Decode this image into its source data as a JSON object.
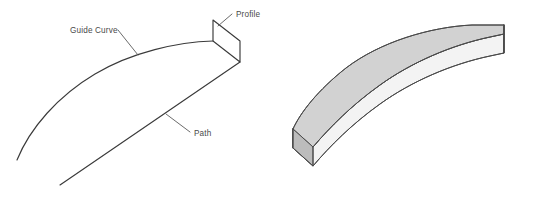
{
  "figure": {
    "background_color": "#ffffff",
    "line_color": "#3a3a3a",
    "leader_color": "#5a5a5a"
  },
  "labels": {
    "guide_curve": "Guide Curve",
    "profile": "Profile",
    "path": "Path"
  },
  "left_panel": {
    "name": "wireframe-construction",
    "guide_curve": {
      "name": "guide-curve",
      "type": "arc",
      "start": [
        17,
        160
      ],
      "end": [
        213,
        41
      ],
      "control": [
        90,
        92
      ]
    },
    "path": {
      "name": "path",
      "type": "line",
      "start": [
        60,
        185
      ],
      "end": [
        240,
        62
      ]
    },
    "profile": {
      "name": "profile",
      "type": "parallelogram",
      "vertices": [
        [
          213,
          20
        ],
        [
          240,
          41
        ],
        [
          240,
          62
        ],
        [
          213,
          41
        ]
      ]
    },
    "leaders": [
      {
        "name": "guide-curve-leader",
        "from": [
          118,
          30
        ],
        "to": [
          138,
          55
        ]
      },
      {
        "name": "profile-leader",
        "from": [
          232,
          14
        ],
        "to": [
          218,
          26
        ]
      },
      {
        "name": "path-leader",
        "from": [
          190,
          132
        ],
        "to": [
          166,
          114
        ]
      }
    ],
    "label_positions": {
      "guide_curve": [
        70,
        33
      ],
      "profile": [
        234,
        17
      ],
      "path": [
        192,
        136
      ]
    }
  },
  "right_panel": {
    "name": "swept-solid",
    "description": "Resulting swept solid body, isometric view",
    "colors": {
      "top_face": "#d2d2d2",
      "front_face": "#f2f2f2",
      "end_face": "#bdbdbd",
      "edge": "#4a4a4a"
    },
    "top_face": {
      "name": "solid-top-face",
      "outline_points": [
        [
          293,
          148
        ],
        [
          293,
          128
        ],
        [
          318,
          94
        ],
        [
          352,
          65
        ],
        [
          394,
          45
        ],
        [
          440,
          33
        ],
        [
          472,
          28
        ],
        [
          504,
          28
        ],
        [
          504,
          44
        ],
        [
          470,
          50
        ],
        [
          430,
          62
        ],
        [
          392,
          80
        ],
        [
          358,
          102
        ],
        [
          330,
          126
        ],
        [
          313,
          148
        ]
      ]
    },
    "front_face": {
      "name": "solid-front-face",
      "outline_points": [
        [
          293,
          148
        ],
        [
          313,
          148
        ],
        [
          330,
          126
        ],
        [
          358,
          102
        ],
        [
          392,
          80
        ],
        [
          430,
          62
        ],
        [
          470,
          50
        ],
        [
          504,
          44
        ],
        [
          504,
          62
        ],
        [
          470,
          68
        ],
        [
          430,
          80
        ],
        [
          392,
          98
        ],
        [
          358,
          120
        ],
        [
          330,
          144
        ],
        [
          313,
          166
        ],
        [
          293,
          166
        ]
      ]
    },
    "end_face": {
      "name": "solid-end-face",
      "outline_points": [
        [
          293,
          128
        ],
        [
          313,
          148
        ],
        [
          313,
          166
        ],
        [
          293,
          146
        ]
      ]
    }
  }
}
